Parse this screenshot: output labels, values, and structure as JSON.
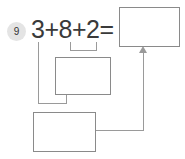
{
  "problem": {
    "number": "9",
    "equation": "3+8+2="
  },
  "boxes": {
    "top": "",
    "middle": "",
    "bottom": ""
  },
  "colors": {
    "badge_background": "#e4e4e4",
    "text": "#3a3a3a",
    "box_border": "#8a8a8a",
    "connector": "#9a9a9a",
    "page_background": "#ffffff"
  },
  "icons": {
    "arrow_up": "arrow-up-icon"
  }
}
